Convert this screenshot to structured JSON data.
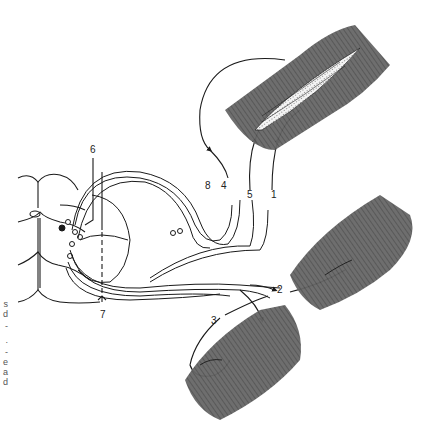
{
  "figure": {
    "labels": [
      {
        "id": "1",
        "text": "1",
        "x": 272,
        "y": 195
      },
      {
        "id": "2",
        "text": "2",
        "x": 283,
        "y": 291
      },
      {
        "id": "3",
        "text": "3",
        "x": 211,
        "y": 316
      },
      {
        "id": "4",
        "text": "4",
        "x": 221,
        "y": 182
      },
      {
        "id": "5",
        "text": "5",
        "x": 247,
        "y": 192
      },
      {
        "id": "6",
        "text": "6",
        "x": 90,
        "y": 145
      },
      {
        "id": "7",
        "text": "7",
        "x": 100,
        "y": 310
      },
      {
        "id": "8",
        "text": "8",
        "x": 205,
        "y": 182
      }
    ],
    "cropped_margin_text": [
      "s",
      "d",
      "-",
      ".",
      "-",
      "e",
      "a",
      "d"
    ]
  },
  "colors": {
    "line": "#1a1a1a",
    "muscle_dark": "#5a5a5a",
    "muscle_mid": "#8a8a8a",
    "background": "#ffffff"
  }
}
